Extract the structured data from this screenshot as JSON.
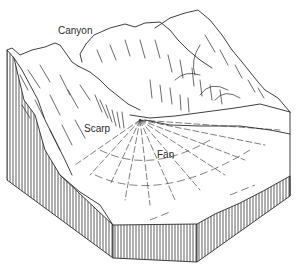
{
  "diagram": {
    "type": "block-diagram",
    "labels": {
      "canyon": "Canyon",
      "scarp": "Scarp",
      "fan": "Fan"
    },
    "colors": {
      "background": "#ffffff",
      "ink": "#2a2a2a"
    }
  }
}
